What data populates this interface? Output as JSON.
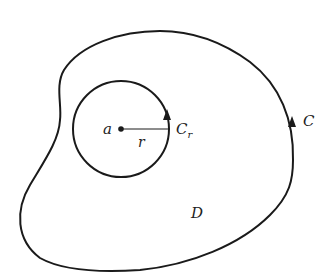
{
  "diagram": {
    "outer_contour": {
      "label": "C",
      "arrow_direction": "counterclockwise"
    },
    "inner_circle": {
      "label": "C",
      "label_subscript": "r",
      "arrow_direction": "counterclockwise"
    },
    "center_point": {
      "label": "a"
    },
    "radius": {
      "label": "r"
    },
    "region": {
      "label": "D"
    },
    "colors": {
      "stroke": "#1a1a1a",
      "background": "#ffffff"
    }
  }
}
